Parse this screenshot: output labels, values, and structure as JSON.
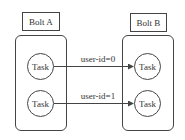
{
  "diagram": {
    "nodes": [
      {
        "id": "bolt_a",
        "label": "Bolt A",
        "tasks": [
          {
            "label": "Task"
          },
          {
            "label": "Task"
          }
        ]
      },
      {
        "id": "bolt_b",
        "label": "Bolt B",
        "tasks": [
          {
            "label": "Task"
          },
          {
            "label": "Task"
          }
        ]
      }
    ],
    "edges": [
      {
        "from": "bolt_a.task0",
        "to": "bolt_b.task0",
        "label": "user-id=0"
      },
      {
        "from": "bolt_a.task1",
        "to": "bolt_b.task1",
        "label": "user-id=1"
      }
    ]
  },
  "colors": {
    "stroke": "#444444",
    "background": "#ffffff",
    "text": "#333333"
  }
}
